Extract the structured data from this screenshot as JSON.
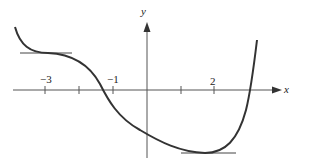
{
  "figure": {
    "type": "function-graph",
    "axes": {
      "x_label": "x",
      "y_label": "y",
      "x_tick_labels": [
        "−3",
        "−1",
        "2"
      ],
      "x_ticks": [
        -3,
        -2,
        -1,
        1,
        2,
        3
      ]
    },
    "curve": {
      "description": "Smooth curve decreasing from upper left with horizontal tangent near x=-3, crossing x-axis near x=-1.3, reaching a minimum with horizontal tangent near x=2, then rising steeply crossing x-axis near x=3",
      "horizontal_tangents": [
        {
          "x": -2.8,
          "label": "local flat near x=-3"
        },
        {
          "x": 2,
          "label": "minimum near x=2"
        }
      ]
    },
    "colors": {
      "curve": "#333333",
      "axes": "#555555"
    }
  }
}
